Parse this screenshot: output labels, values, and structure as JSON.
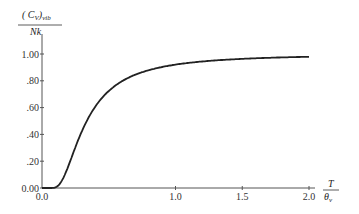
{
  "chart_data": {
    "type": "line",
    "title": "",
    "ylabel": {
      "numerator": "( C",
      "numerator_sub": "V",
      "numerator_post": ")",
      "numerator_post_sub": "vib",
      "denominator": "Nk"
    },
    "xlabel": {
      "numerator": "T",
      "denominator": "θ",
      "denominator_sub": "v"
    },
    "xlim": [
      0.0,
      2.0
    ],
    "ylim": [
      0.0,
      1.0
    ],
    "grid": false,
    "x_ticks": [
      "0.0",
      "1.0",
      "1.5",
      "2.0"
    ],
    "x_tick_values": [
      0.0,
      1.0,
      1.5,
      2.0
    ],
    "y_ticks": [
      "0.00",
      ".20",
      ".40",
      ".60",
      ".80",
      "1.00"
    ],
    "y_tick_values": [
      0.0,
      0.2,
      0.4,
      0.6,
      0.8,
      1.0
    ],
    "series": [
      {
        "name": "Einstein vibrational heat capacity",
        "x": [
          0.0,
          0.1,
          0.15,
          0.2,
          0.25,
          0.3,
          0.35,
          0.4,
          0.5,
          0.6,
          0.7,
          0.8,
          0.9,
          1.0,
          1.2,
          1.4,
          1.6,
          1.8,
          2.0
        ],
        "values": [
          0.0,
          0.005,
          0.031,
          0.171,
          0.296,
          0.411,
          0.513,
          0.597,
          0.724,
          0.799,
          0.848,
          0.886,
          0.906,
          0.921,
          0.944,
          0.958,
          0.968,
          0.975,
          0.979
        ]
      }
    ]
  }
}
